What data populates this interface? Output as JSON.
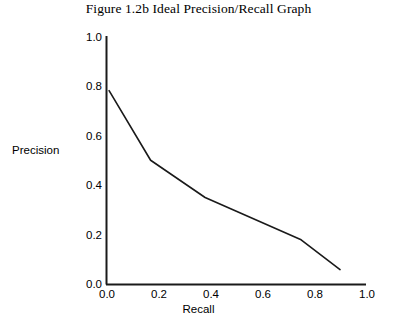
{
  "chart_data": {
    "type": "line",
    "title": "Figure 1.2b  Ideal Precision/Recall Graph",
    "xlabel": "Recall",
    "ylabel": "Precision",
    "xlim": [
      0.0,
      1.0
    ],
    "ylim": [
      0.0,
      1.0
    ],
    "grid": false,
    "legend": "none",
    "xticks": [
      "0.0",
      "0.2",
      "0.4",
      "0.6",
      "0.8",
      "1.0"
    ],
    "yticks": [
      "0.0",
      "0.2",
      "0.4",
      "0.6",
      "0.8",
      "1.0"
    ],
    "series": [
      {
        "name": "Ideal precision/recall curve",
        "x": [
          0.01,
          0.17,
          0.38,
          0.75,
          0.9
        ],
        "values": [
          0.78,
          0.5,
          0.35,
          0.18,
          0.06
        ],
        "color": "#1a1a1a"
      }
    ]
  },
  "axes": {
    "line_color": "#1a1a1a"
  }
}
